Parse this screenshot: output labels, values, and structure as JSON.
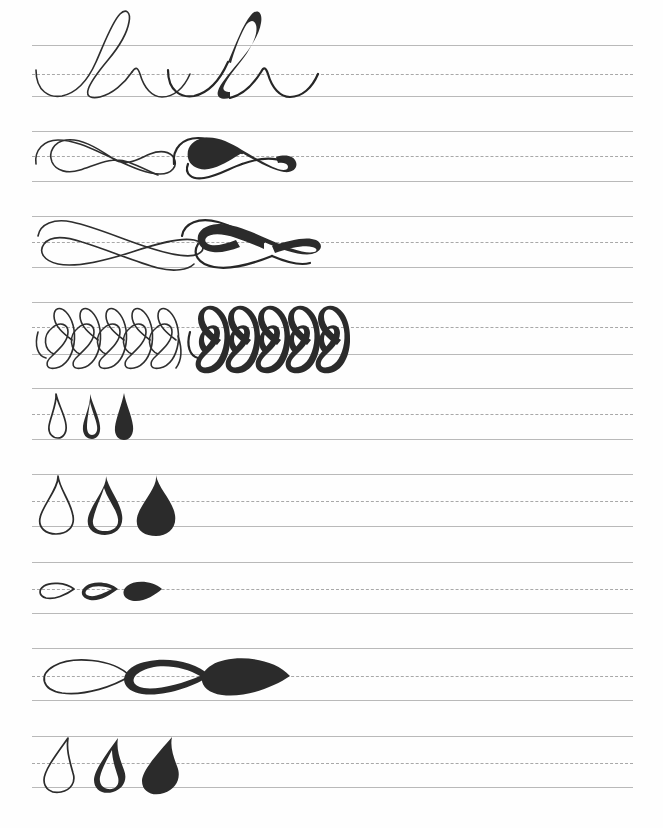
{
  "document": {
    "title": "Calligraphy Basic Strokes Practice Sheet",
    "type": "handwriting-practice-worksheet",
    "page_width": 663,
    "page_height": 828,
    "background_color": "#fefefe",
    "ink_color": "#2b2b2b",
    "rule_color": "#b9b9b9",
    "midline_color": "#9a9a9a",
    "rule_left": 32,
    "rule_right": 633,
    "rule_count": 9,
    "midline_style": "dashed"
  },
  "rows": [
    {
      "index": 1,
      "name": "overturn-underturn-loop-row",
      "label": "Looped ascender compound stroke",
      "top_line_y": 45,
      "mid_line_y": 74,
      "base_line_y": 96,
      "exemplars": [
        {
          "stage": "monoline",
          "weight": "thin",
          "x": 36
        },
        {
          "stage": "weighted",
          "weight": "thick-downstroke",
          "x": 168
        }
      ]
    },
    {
      "index": 2,
      "name": "horizontal-figure-eight-row",
      "label": "Horizontal figure-eight flourish",
      "top_line_y": 131,
      "mid_line_y": 156,
      "base_line_y": 181,
      "exemplars": [
        {
          "stage": "monoline",
          "weight": "thin",
          "x": 34
        },
        {
          "stage": "weighted",
          "weight": "thick-downstroke",
          "x": 168
        }
      ]
    },
    {
      "index": 3,
      "name": "crossed-loop-flourish-row",
      "label": "Crossed elongated loop flourish",
      "top_line_y": 216,
      "mid_line_y": 242,
      "base_line_y": 267,
      "exemplars": [
        {
          "stage": "monoline",
          "weight": "thin",
          "x": 34
        },
        {
          "stage": "weighted",
          "weight": "thick-downstroke",
          "x": 176
        }
      ]
    },
    {
      "index": 4,
      "name": "repeated-vertical-loop-row",
      "label": "Repeated vertical figure-eight coils",
      "top_line_y": 302,
      "mid_line_y": 327,
      "base_line_y": 354,
      "exemplars": [
        {
          "stage": "monoline",
          "weight": "thin",
          "x": 50,
          "repeats": 5
        },
        {
          "stage": "weighted",
          "weight": "thick-downstroke",
          "x": 180,
          "repeats": 5
        }
      ]
    },
    {
      "index": 5,
      "name": "small-vertical-teardrop-row",
      "label": "Small vertical teardrop / leaf stroke",
      "top_line_y": 388,
      "mid_line_y": 414,
      "base_line_y": 439,
      "exemplars": [
        {
          "stage": "outline",
          "weight": "thin",
          "x": 50
        },
        {
          "stage": "partial-fill",
          "weight": "thick-left",
          "x": 85
        },
        {
          "stage": "solid",
          "weight": "full-brush",
          "x": 118
        }
      ]
    },
    {
      "index": 6,
      "name": "large-vertical-teardrop-row",
      "label": "Large vertical teardrop / leaf stroke",
      "top_line_y": 474,
      "mid_line_y": 501,
      "base_line_y": 526,
      "exemplars": [
        {
          "stage": "outline",
          "weight": "thin",
          "x": 46
        },
        {
          "stage": "partial-fill",
          "weight": "thick-left",
          "x": 93
        },
        {
          "stage": "solid",
          "weight": "full-brush",
          "x": 143
        }
      ]
    },
    {
      "index": 7,
      "name": "small-horizontal-teardrop-row",
      "label": "Small horizontal teardrop pointing right",
      "top_line_y": 562,
      "mid_line_y": 589,
      "base_line_y": 613,
      "exemplars": [
        {
          "stage": "outline",
          "weight": "thin",
          "x": 38
        },
        {
          "stage": "partial-fill",
          "weight": "thick-bottom",
          "x": 82
        },
        {
          "stage": "solid",
          "weight": "full-brush",
          "x": 124
        }
      ]
    },
    {
      "index": 8,
      "name": "large-horizontal-teardrop-row",
      "label": "Large horizontal teardrop pointing right",
      "top_line_y": 648,
      "mid_line_y": 676,
      "base_line_y": 700,
      "exemplars": [
        {
          "stage": "outline",
          "weight": "thin",
          "x": 40
        },
        {
          "stage": "partial-fill",
          "weight": "thick-bottom",
          "x": 120
        },
        {
          "stage": "solid",
          "weight": "full-brush",
          "x": 198
        }
      ]
    },
    {
      "index": 9,
      "name": "comma-flame-stroke-row",
      "label": "Comma / flame stroke",
      "top_line_y": 736,
      "mid_line_y": 763,
      "base_line_y": 787,
      "exemplars": [
        {
          "stage": "outline",
          "weight": "thin",
          "x": 50
        },
        {
          "stage": "partial-fill",
          "weight": "thick-right",
          "x": 100
        },
        {
          "stage": "solid",
          "weight": "full-brush",
          "x": 152
        }
      ]
    }
  ]
}
